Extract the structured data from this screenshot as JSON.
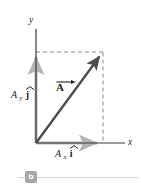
{
  "figure": {
    "kind": "vector-component-diagram",
    "panel_label": "b",
    "axes": {
      "y_label": "y",
      "x_label": "x",
      "origin": [
        36,
        143
      ],
      "x_axis_end": [
        125,
        143
      ],
      "y_axis_top": [
        36,
        28
      ]
    },
    "vector": {
      "label_base": "A",
      "label_accent": "arrow",
      "label_text": "A",
      "tail": [
        36,
        143
      ],
      "tip": [
        103,
        52
      ],
      "color": "#4d4d4d"
    },
    "components": {
      "x_component": {
        "symbol": "A",
        "subscript": "x",
        "unit_vector": "i",
        "unit_vector_accent": "hat",
        "label_text": "A x i",
        "from": [
          36,
          143
        ],
        "to": [
          103,
          143
        ],
        "color": "#b3b3b3"
      },
      "y_component": {
        "symbol": "A",
        "subscript": "y",
        "unit_vector": "j",
        "unit_vector_accent": "hat",
        "label_text": "A y j",
        "from": [
          36,
          143
        ],
        "to": [
          36,
          52
        ],
        "color": "#b3b3b3"
      }
    },
    "construction_lines": [
      {
        "name": "horizontal-dashed",
        "from": [
          36,
          52
        ],
        "to": [
          103,
          52
        ]
      },
      {
        "name": "vertical-dashed",
        "from": [
          103,
          52
        ],
        "to": [
          103,
          143
        ]
      }
    ],
    "colors": {
      "background": "#ffffff",
      "axis": "#3a3a3a",
      "vector": "#4d4d4d",
      "component_arrow": "#b3b3b3",
      "dashed": "#8a8a8a",
      "badge_fill": "#a8a8a8",
      "badge_text": "#ffffff",
      "rule": "#d6d6d6",
      "text": "#231f20"
    }
  }
}
